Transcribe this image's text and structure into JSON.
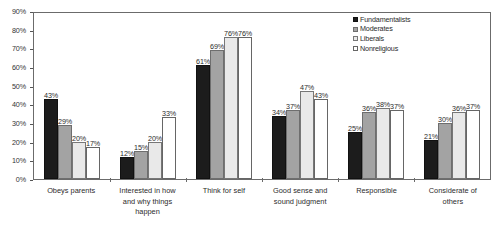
{
  "chart_data": {
    "type": "bar",
    "title": "",
    "subtitle": "",
    "xlabel": "",
    "ylabel": "",
    "ylim": [
      0,
      90
    ],
    "ytick_labels": [
      "0%",
      "10%",
      "20%",
      "30%",
      "40%",
      "50%",
      "60%",
      "70%",
      "80%",
      "90%"
    ],
    "ytick_values": [
      0,
      10,
      20,
      30,
      40,
      50,
      60,
      70,
      80,
      90
    ],
    "grid": false,
    "legend_position": "top-right",
    "value_label_suffix": "%",
    "categories": [
      "Obeys parents",
      "Interested in how and why things happen",
      "Think for self",
      "Good sense and sound judgment",
      "Responsible",
      "Considerate of others"
    ],
    "category_lines": [
      [
        "Obeys parents"
      ],
      [
        "Interested in how",
        "and why things",
        "happen"
      ],
      [
        "Think for self"
      ],
      [
        "Good sense and",
        "sound judgment"
      ],
      [
        "Responsible"
      ],
      [
        "Considerate of",
        "others"
      ]
    ],
    "series": [
      {
        "name": "Fundamentalists",
        "color": "#1c1c1c",
        "values": [
          43,
          12,
          61,
          34,
          25,
          21
        ],
        "labels": [
          "43%",
          "12%",
          "61%",
          "34%",
          "25%",
          "21%"
        ]
      },
      {
        "name": "Moderates",
        "color": "#a3a3a3",
        "values": [
          29,
          15,
          69,
          37,
          36,
          30
        ],
        "labels": [
          "29%",
          "15%",
          "69%",
          "37%",
          "36%",
          "30%"
        ]
      },
      {
        "name": "Liberals",
        "color": "#e9e9e9",
        "values": [
          20,
          20,
          76,
          47,
          38,
          36
        ],
        "labels": [
          "20%",
          "20%",
          "76%",
          "47%",
          "38%",
          "36%"
        ]
      },
      {
        "name": "Nonreligious",
        "color": "#ffffff",
        "values": [
          17,
          33,
          76,
          43,
          37,
          37
        ],
        "labels": [
          "17%",
          "33%",
          "76%",
          "43%",
          "37%",
          "37%"
        ]
      }
    ]
  }
}
